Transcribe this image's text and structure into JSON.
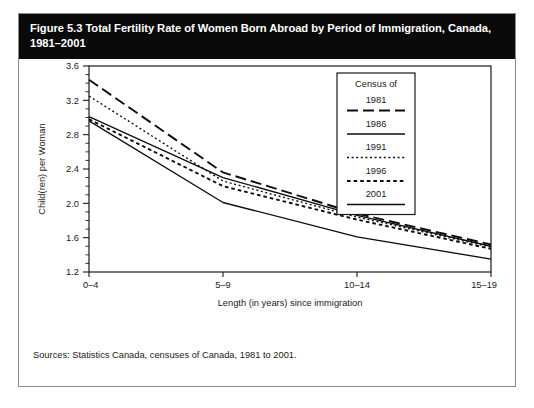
{
  "figure": {
    "title": "Figure 5.3 Total Fertility Rate of Women Born Abroad by Period of Immigration, Canada, 1981–2001",
    "source_note": "Sources: Statistics Canada, censuses of Canada, 1981 to 2001."
  },
  "legend": {
    "title": "Census of",
    "entries": [
      {
        "label": "1981",
        "style": "long-dash"
      },
      {
        "label": "1986",
        "style": "solid"
      },
      {
        "label": "1991",
        "style": "fine-dot"
      },
      {
        "label": "1996",
        "style": "short-dash"
      },
      {
        "label": "2001",
        "style": "solid"
      }
    ]
  },
  "chart_data": {
    "type": "line",
    "title": "Total Fertility Rate of Women Born Abroad by Period of Immigration, Canada, 1981–2001",
    "xlabel": "Length (in years) since immigration",
    "ylabel": "Child(ren) per Woman",
    "categories": [
      "0–4",
      "5–9",
      "10–14",
      "15–19"
    ],
    "ylim": [
      1.2,
      3.6
    ],
    "yticks": [
      1.2,
      1.6,
      2.0,
      2.4,
      2.8,
      3.2,
      3.6
    ],
    "ytick_labels": [
      "1.2",
      "1.6",
      "2.0",
      "2.4",
      "2.8",
      "3.2",
      "3.6"
    ],
    "yminor_step": 0.1,
    "grid": false,
    "legend_position": "upper-right",
    "series": [
      {
        "name": "1981",
        "dash": "long-dash",
        "values": [
          3.44,
          2.36,
          1.88,
          1.52
        ]
      },
      {
        "name": "1986",
        "dash": "solid",
        "values": [
          3.01,
          2.3,
          1.86,
          1.5
        ]
      },
      {
        "name": "1991",
        "dash": "fine-dot",
        "values": [
          3.25,
          2.26,
          1.84,
          1.49
        ]
      },
      {
        "name": "1996",
        "dash": "short-dash",
        "values": [
          2.98,
          2.2,
          1.81,
          1.47
        ]
      },
      {
        "name": "2001",
        "dash": "solid",
        "values": [
          2.96,
          2.01,
          1.61,
          1.35
        ]
      }
    ]
  }
}
